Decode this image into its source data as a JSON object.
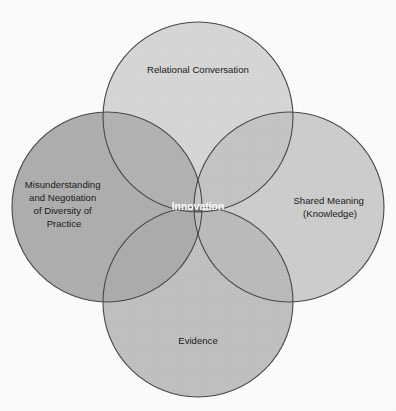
{
  "diagram": {
    "type": "venn",
    "background_color": "#fefefe",
    "outline_color": "#4a4a4a",
    "circles": [
      {
        "id": "top",
        "label": "Relational Conversation",
        "cx": 198,
        "cy": 117,
        "r": 95,
        "fill": "#d8d8d8",
        "label_x": 198,
        "label_y": 70
      },
      {
        "id": "left",
        "label_lines": [
          "Misunderstanding",
          "and Negotiation",
          "of Diversity of",
          "Practice"
        ],
        "cx": 107,
        "cy": 207,
        "r": 95,
        "fill": "#b0b0b0",
        "label_x": 64,
        "label_y": 207
      },
      {
        "id": "right",
        "label_lines": [
          "Shared Meaning",
          "(Knowledge)"
        ],
        "cx": 289,
        "cy": 207,
        "r": 95,
        "fill": "#cfcfcf",
        "label_x": 330,
        "label_y": 207
      },
      {
        "id": "bottom",
        "label": "Evidence",
        "cx": 198,
        "cy": 302,
        "r": 95,
        "fill": "#c2c2c2",
        "label_x": 198,
        "label_y": 341
      }
    ],
    "center": {
      "label": "Innovation",
      "fill": "#6e6e6e",
      "text_color": "#ffffff",
      "cx": 198,
      "cy": 207
    },
    "overlaps": [
      {
        "id": "top-left",
        "fill": "#b4b4b4"
      },
      {
        "id": "top-right",
        "fill": "#c6c6c6"
      },
      {
        "id": "bottom-left",
        "fill": "#aeaeae"
      },
      {
        "id": "bottom-right",
        "fill": "#bdbdbd"
      }
    ]
  }
}
